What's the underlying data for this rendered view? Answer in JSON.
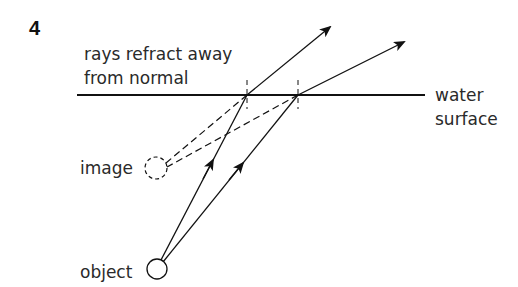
{
  "question_number": "4",
  "labels": {
    "annotation_line1": "rays refract away",
    "annotation_line2": "from normal",
    "surface_line1": "water",
    "surface_line2": "surface",
    "image": "image",
    "object": "object"
  },
  "colors": {
    "line": "#111111",
    "text": "#2a2a2a",
    "background": "#ffffff"
  },
  "geometry": {
    "water_surface": {
      "x1": 77,
      "x2": 425,
      "y": 95
    },
    "normals": [
      {
        "x": 247,
        "y1": 80,
        "y2": 108
      },
      {
        "x": 298,
        "y1": 80,
        "y2": 108
      }
    ],
    "object": {
      "cx": 157,
      "cy": 269,
      "r": 10
    },
    "image": {
      "cx": 156,
      "cy": 168,
      "r": 11
    },
    "rays": [
      {
        "from": [
          161,
          260
        ],
        "surface_point": [
          247,
          95
        ],
        "refracted_to": [
          330,
          27
        ]
      },
      {
        "from": [
          163,
          262
        ],
        "surface_point": [
          298,
          95
        ],
        "refracted_to": [
          404,
          42
        ]
      }
    ]
  }
}
